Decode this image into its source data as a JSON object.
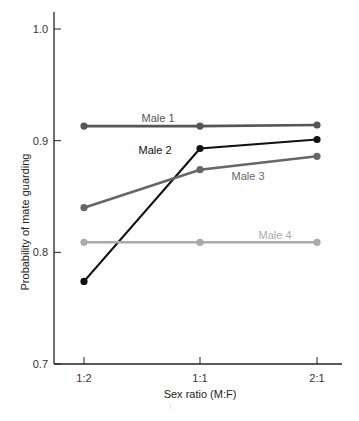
{
  "chart_data": {
    "type": "line",
    "title": "",
    "xlabel": "Sex ratio (M:F)",
    "ylabel": "Probability of mate guarding",
    "categories": [
      "1:2",
      "1:1",
      "2:1"
    ],
    "ylim": [
      0.7,
      1.0
    ],
    "yticks": [
      {
        "value": 0.7,
        "label": "0.7"
      },
      {
        "value": 0.8,
        "label": "0.8"
      },
      {
        "value": 0.9,
        "label": "0.9"
      },
      {
        "value": 1.0,
        "label": "1.0"
      }
    ],
    "grid": false,
    "legend": "inline labels",
    "series": [
      {
        "name": "Male 1",
        "values": [
          0.913,
          0.913,
          0.914
        ],
        "color": "#555555",
        "label_pos": {
          "x": 158,
          "y": 122
        }
      },
      {
        "name": "Male 2",
        "values": [
          0.774,
          0.893,
          0.901
        ],
        "color": "#111111",
        "label_pos": {
          "x": 155,
          "y": 154
        }
      },
      {
        "name": "Male 3",
        "values": [
          0.84,
          0.874,
          0.886
        ],
        "color": "#666666",
        "label_pos": {
          "x": 248,
          "y": 180
        }
      },
      {
        "name": "Male 4",
        "values": [
          0.809,
          0.809,
          0.809
        ],
        "color": "#aaaaaa",
        "label_pos": {
          "x": 275,
          "y": 239
        }
      }
    ]
  }
}
